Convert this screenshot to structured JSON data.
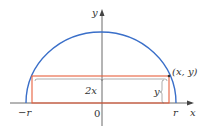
{
  "figure": {
    "axes": {
      "x_label": "x",
      "y_label": "y",
      "origin_label": "0",
      "neg_r_label": "−r",
      "pos_r_label": "r"
    },
    "annotations": {
      "point_label": "(x, y)",
      "width_label": "2x",
      "height_label": "y"
    },
    "colors": {
      "semicircle": "#3a6fc9",
      "rectangle": "#e8603c",
      "axis": "#444444",
      "bracket": "#777777"
    }
  }
}
